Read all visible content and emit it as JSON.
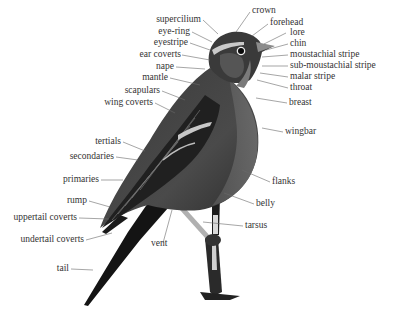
{
  "diagram": {
    "labels": {
      "crown": "crown",
      "forehead": "forehead",
      "lore": "lore",
      "chin": "chin",
      "moustachial_stripe": "moustachial stripe",
      "sub_moustachial_stripe": "sub-moustachial stripe",
      "malar_stripe": "malar stripe",
      "throat": "throat",
      "breast": "breast",
      "wingbar": "wingbar",
      "flanks": "flanks",
      "belly": "belly",
      "tarsus": "tarsus",
      "vent": "vent",
      "supercilium": "supercilium",
      "eye_ring": "eye-ring",
      "eyestripe": "eyestripe",
      "ear_coverts": "ear coverts",
      "nape": "nape",
      "mantle": "mantle",
      "scapulars": "scapulars",
      "wing_coverts": "wing coverts",
      "tertials": "tertials",
      "secondaries": "secondaries",
      "primaries": "primaries",
      "rump": "rump",
      "uppertail_coverts": "uppertail coverts",
      "undertail_coverts": "undertail coverts",
      "tail": "tail"
    },
    "colors": {
      "background": "#ffffff",
      "text": "#333333",
      "leader_line": "#666666",
      "bird_dark": "#1e1e1e",
      "bird_mid": "#555555",
      "bird_light": "#9a9a9a"
    }
  }
}
